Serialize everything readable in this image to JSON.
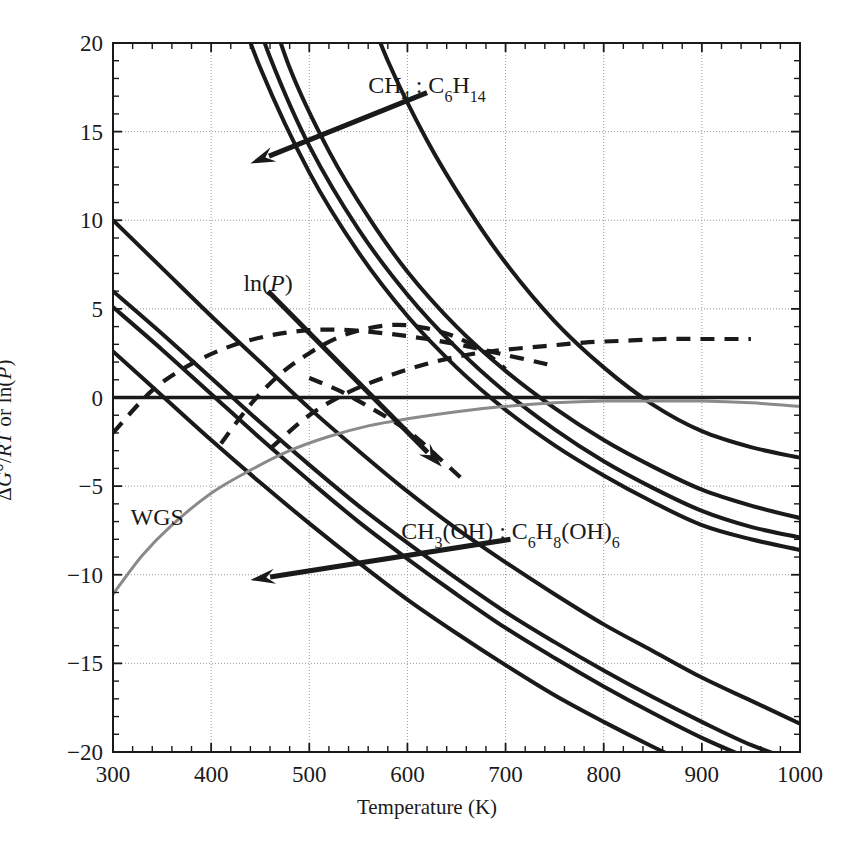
{
  "chart_data": {
    "type": "line",
    "title": "",
    "xlabel": "Temperature (K)",
    "ylabel": "ΔG°/RT or ln(P)",
    "xlim": [
      300,
      1000
    ],
    "ylim": [
      -20,
      20
    ],
    "xticks": [
      300,
      400,
      500,
      600,
      700,
      800,
      900,
      1000
    ],
    "yticks": [
      -20,
      -15,
      -10,
      -5,
      0,
      5,
      10,
      15,
      20
    ],
    "x_minor_step": 20,
    "y_minor_step": 1,
    "grid": true,
    "legend_position": "inline-annotations",
    "annotations": [
      {
        "id": "ann-ch4-c6h14",
        "text": "CH₄ : C₆H₁₄",
        "x": 620,
        "y": 17.2,
        "arrow_to": {
          "x": 440,
          "y": 13.2
        }
      },
      {
        "id": "ann-lnp",
        "text": "ln(P)",
        "x": 458,
        "y": 6.0,
        "arrow_to": {
          "x": 635,
          "y": -3.9
        }
      },
      {
        "id": "ann-ch3oh-c6h8oh6",
        "text": "CH₃(OH) : C₆H₈(OH)₆",
        "x": 705,
        "y": -8.0,
        "arrow_to": {
          "x": 440,
          "y": -10.3
        }
      },
      {
        "id": "ann-wgs",
        "text": "WGS",
        "x": 345,
        "y": -7.2,
        "arrow_to": null
      }
    ],
    "series": [
      {
        "name": "dG-solid-1",
        "style": "solid",
        "color": "#1a1a1a",
        "points": [
          [
            300,
            10.0
          ],
          [
            350,
            7.3
          ],
          [
            400,
            4.6
          ],
          [
            450,
            2.0
          ],
          [
            500,
            -0.6
          ],
          [
            550,
            -3.0
          ],
          [
            600,
            -5.3
          ],
          [
            650,
            -7.4
          ],
          [
            700,
            -9.3
          ],
          [
            750,
            -11.1
          ],
          [
            800,
            -12.8
          ],
          [
            850,
            -14.3
          ],
          [
            900,
            -15.8
          ],
          [
            950,
            -17.1
          ],
          [
            1000,
            -18.4
          ]
        ]
      },
      {
        "name": "dG-solid-2",
        "style": "solid",
        "color": "#1a1a1a",
        "points": [
          [
            300,
            6.0
          ],
          [
            350,
            3.6
          ],
          [
            400,
            1.1
          ],
          [
            450,
            -1.4
          ],
          [
            500,
            -3.8
          ],
          [
            550,
            -6.1
          ],
          [
            600,
            -8.2
          ],
          [
            650,
            -10.2
          ],
          [
            700,
            -12.1
          ],
          [
            750,
            -13.8
          ],
          [
            800,
            -15.4
          ],
          [
            850,
            -16.9
          ],
          [
            900,
            -18.3
          ],
          [
            950,
            -19.6
          ],
          [
            1000,
            -20.6
          ]
        ]
      },
      {
        "name": "dG-solid-3",
        "style": "solid",
        "color": "#1a1a1a",
        "points": [
          [
            300,
            5.1
          ],
          [
            350,
            2.7
          ],
          [
            400,
            0.2
          ],
          [
            450,
            -2.3
          ],
          [
            500,
            -4.7
          ],
          [
            550,
            -7.0
          ],
          [
            600,
            -9.1
          ],
          [
            650,
            -11.1
          ],
          [
            700,
            -13.0
          ],
          [
            750,
            -14.7
          ],
          [
            800,
            -16.3
          ],
          [
            850,
            -17.8
          ],
          [
            900,
            -19.2
          ],
          [
            950,
            -20.4
          ],
          [
            1000,
            -21.5
          ]
        ]
      },
      {
        "name": "dG-solid-4",
        "style": "solid",
        "color": "#1a1a1a",
        "points": [
          [
            300,
            2.6
          ],
          [
            350,
            0.1
          ],
          [
            400,
            -2.4
          ],
          [
            450,
            -4.8
          ],
          [
            500,
            -7.1
          ],
          [
            550,
            -9.3
          ],
          [
            600,
            -11.4
          ],
          [
            650,
            -13.3
          ],
          [
            700,
            -15.1
          ],
          [
            750,
            -16.8
          ],
          [
            800,
            -18.3
          ],
          [
            850,
            -19.7
          ],
          [
            900,
            -21.0
          ],
          [
            950,
            -22.1
          ],
          [
            1000,
            -23.2
          ]
        ]
      },
      {
        "name": "lnP-solid-a",
        "style": "solid",
        "color": "#1a1a1a",
        "points": [
          [
            415,
            24.0
          ],
          [
            450,
            18.6
          ],
          [
            500,
            12.7
          ],
          [
            550,
            8.2
          ],
          [
            600,
            4.6
          ],
          [
            650,
            1.7
          ],
          [
            700,
            -0.7
          ],
          [
            750,
            -2.7
          ],
          [
            800,
            -4.4
          ],
          [
            850,
            -5.9
          ],
          [
            900,
            -7.2
          ],
          [
            950,
            -8.0
          ],
          [
            1000,
            -8.6
          ]
        ]
      },
      {
        "name": "lnP-solid-b",
        "style": "solid",
        "color": "#1a1a1a",
        "points": [
          [
            430,
            24.0
          ],
          [
            460,
            19.2
          ],
          [
            500,
            14.2
          ],
          [
            550,
            9.5
          ],
          [
            600,
            5.8
          ],
          [
            650,
            2.8
          ],
          [
            700,
            0.3
          ],
          [
            750,
            -1.8
          ],
          [
            800,
            -3.6
          ],
          [
            850,
            -5.1
          ],
          [
            900,
            -6.4
          ],
          [
            950,
            -7.3
          ],
          [
            1000,
            -7.9
          ]
        ]
      },
      {
        "name": "lnP-solid-c",
        "style": "solid",
        "color": "#1a1a1a",
        "points": [
          [
            448,
            24.0
          ],
          [
            480,
            18.6
          ],
          [
            520,
            13.9
          ],
          [
            560,
            10.2
          ],
          [
            600,
            7.1
          ],
          [
            650,
            4.0
          ],
          [
            700,
            1.5
          ],
          [
            750,
            -0.6
          ],
          [
            800,
            -2.4
          ],
          [
            850,
            -3.9
          ],
          [
            900,
            -5.2
          ],
          [
            950,
            -6.1
          ],
          [
            1000,
            -6.8
          ]
        ]
      },
      {
        "name": "lnP-solid-d",
        "style": "solid",
        "color": "#1a1a1a",
        "points": [
          [
            545,
            24.0
          ],
          [
            580,
            19.0
          ],
          [
            620,
            14.5
          ],
          [
            660,
            10.8
          ],
          [
            700,
            7.6
          ],
          [
            750,
            4.3
          ],
          [
            800,
            1.7
          ],
          [
            850,
            -0.4
          ],
          [
            900,
            -1.9
          ],
          [
            950,
            -2.8
          ],
          [
            1000,
            -3.4
          ]
        ]
      },
      {
        "name": "lnP-dashed-1",
        "style": "dashed",
        "color": "#1a1a1a",
        "points": [
          [
            410,
            -2.6
          ],
          [
            440,
            -0.4
          ],
          [
            470,
            1.3
          ],
          [
            500,
            2.5
          ],
          [
            530,
            3.4
          ],
          [
            560,
            3.9
          ],
          [
            590,
            4.1
          ],
          [
            620,
            3.9
          ],
          [
            650,
            3.4
          ],
          [
            680,
            2.5
          ],
          [
            700,
            1.6
          ]
        ]
      },
      {
        "name": "lnP-dashed-2",
        "style": "dashed",
        "color": "#1a1a1a",
        "points": [
          [
            300,
            -2.0
          ],
          [
            340,
            0.4
          ],
          [
            380,
            1.9
          ],
          [
            420,
            2.9
          ],
          [
            460,
            3.5
          ],
          [
            500,
            3.8
          ],
          [
            540,
            3.8
          ],
          [
            580,
            3.6
          ],
          [
            620,
            3.3
          ],
          [
            660,
            2.9
          ],
          [
            700,
            2.4
          ],
          [
            740,
            1.9
          ],
          [
            748,
            1.7
          ]
        ]
      },
      {
        "name": "lnP-dashed-3",
        "style": "dashed",
        "color": "#1a1a1a",
        "points": [
          [
            460,
            -2.9
          ],
          [
            500,
            -1.0
          ],
          [
            540,
            0.3
          ],
          [
            580,
            1.2
          ],
          [
            620,
            1.9
          ],
          [
            660,
            2.4
          ],
          [
            700,
            2.7
          ],
          [
            740,
            2.9
          ],
          [
            780,
            3.1
          ],
          [
            820,
            3.2
          ],
          [
            860,
            3.3
          ],
          [
            900,
            3.3
          ],
          [
            940,
            3.3
          ],
          [
            950,
            3.3
          ]
        ]
      },
      {
        "name": "lnP-dashed-4",
        "style": "dashed",
        "color": "#1a1a1a",
        "points": [
          [
            500,
            1.1
          ],
          [
            530,
            0.4
          ],
          [
            560,
            -0.5
          ],
          [
            590,
            -1.5
          ],
          [
            610,
            -2.3
          ],
          [
            630,
            -3.3
          ],
          [
            650,
            -4.3
          ],
          [
            658,
            -4.7
          ]
        ]
      },
      {
        "name": "WGS",
        "style": "solid",
        "color": "#8a8a8a",
        "points": [
          [
            300,
            -11.1
          ],
          [
            330,
            -8.9
          ],
          [
            360,
            -7.2
          ],
          [
            400,
            -5.4
          ],
          [
            440,
            -4.1
          ],
          [
            480,
            -3.0
          ],
          [
            520,
            -2.2
          ],
          [
            560,
            -1.6
          ],
          [
            600,
            -1.2
          ],
          [
            650,
            -0.8
          ],
          [
            700,
            -0.5
          ],
          [
            750,
            -0.3
          ],
          [
            800,
            -0.2
          ],
          [
            850,
            -0.2
          ],
          [
            900,
            -0.2
          ],
          [
            950,
            -0.3
          ],
          [
            1000,
            -0.5
          ]
        ]
      },
      {
        "name": "zero-line",
        "style": "solid-thick",
        "color": "#1a1a1a",
        "points": [
          [
            300,
            0
          ],
          [
            1000,
            0
          ]
        ]
      }
    ]
  }
}
